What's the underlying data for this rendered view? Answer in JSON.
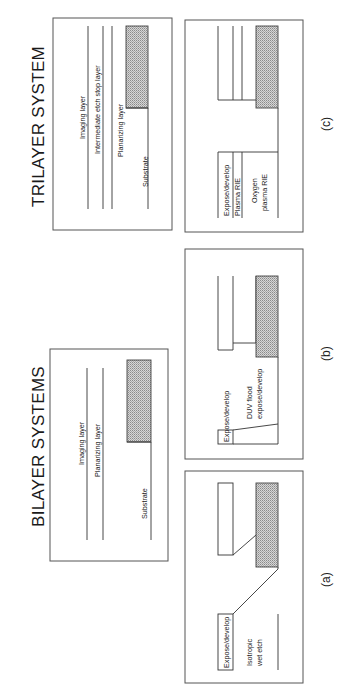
{
  "titles": {
    "bilayer": "BILAYER SYSTEMS",
    "trilayer": "TRILAYER SYSTEM"
  },
  "panel_labels": {
    "a": "(a)",
    "b": "(b)",
    "c": "(c)"
  },
  "bilayer_stack": {
    "layers": [
      "Imaging layer",
      "Planarizing layer",
      "Substrate"
    ]
  },
  "trilayer_stack": {
    "layers": [
      "Imaging layer",
      "Intermediate etch stop layer",
      "Planarizing layer",
      "Substrate"
    ]
  },
  "panel_a": {
    "steps": [
      "Expose/develop",
      "Isotropic",
      "wet etch"
    ]
  },
  "panel_b": {
    "steps": [
      "Expose/develop",
      "DUV flood",
      "expose/develop"
    ]
  },
  "panel_c": {
    "steps": [
      "Expose/develop",
      "Plasma RIE",
      "Oxygen",
      "plasma RIE"
    ]
  },
  "colors": {
    "line": "#333333",
    "frame": "#555555",
    "hatch_fill": "#bdbdbd"
  }
}
